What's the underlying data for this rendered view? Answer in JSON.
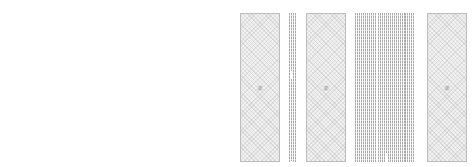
{
  "pages": [
    {
      "figures": [
        {
          "label": "Fig",
          "x": 8,
          "w": 40
        },
        {
          "label": "Fig",
          "x": 72,
          "w": 40
        },
        {
          "label": "Fig",
          "x": 185,
          "w": 40
        }
      ],
      "columns": [
        {
          "x": 52,
          "top": 13,
          "lines": [
            {
              "dx": 0,
              "top": 0,
              "h": 149
            },
            {
              "dx": 2,
              "top": 0,
              "h": 140
            },
            {
              "dx": 5,
              "top": 17,
              "h": 132
            },
            {
              "dx": 7,
              "top": 22,
              "h": 127
            }
          ]
        },
        {
          "x": 61,
          "top": 13,
          "lines": [
            {
              "dx": 0,
              "top": 0,
              "h": 149
            },
            {
              "dx": 2,
              "top": 0,
              "h": 149
            },
            {
              "dx": 4,
              "top": 0,
              "h": 149
            },
            {
              "dx": 6,
              "top": 0,
              "h": 149
            }
          ]
        },
        {
          "x": 113,
          "top": 13,
          "lines": [
            {
              "dx": 0,
              "top": 0,
              "h": 149
            },
            {
              "dx": 2,
              "top": 0,
              "h": 149
            },
            {
              "dx": 4,
              "top": 0,
              "h": 149
            },
            {
              "dx": 7,
              "top": 0,
              "h": 149
            }
          ]
        },
        {
          "x": 122,
          "top": 13,
          "lines": [
            {
              "dx": 0,
              "top": 0,
              "h": 149
            },
            {
              "dx": 3,
              "top": 0,
              "h": 149
            }
          ]
        },
        {
          "x": 129,
          "top": 13,
          "lines": [
            {
              "dx": 0,
              "top": 0,
              "h": 149
            },
            {
              "dx": 2,
              "top": 0,
              "h": 149
            },
            {
              "dx": 4,
              "top": 0,
              "h": 149
            },
            {
              "dx": 6,
              "top": 0,
              "h": 149
            },
            {
              "dx": 8,
              "top": 0,
              "h": 149
            },
            {
              "dx": 10,
              "top": 0,
              "h": 149
            },
            {
              "dx": 12,
              "top": 10,
              "h": 139
            },
            {
              "dx": 14,
              "top": 15,
              "h": 134
            }
          ]
        },
        {
          "x": 150,
          "top": 13,
          "lines": [
            {
              "dx": 0,
              "top": 0,
              "h": 149
            },
            {
              "dx": 2,
              "top": 0,
              "h": 149
            },
            {
              "dx": 4,
              "top": 0,
              "h": 149
            },
            {
              "dx": 6,
              "top": 0,
              "h": 149
            },
            {
              "dx": 8,
              "top": 0,
              "h": 149
            }
          ]
        },
        {
          "x": 166,
          "top": 13,
          "lines": [
            {
              "dx": 0,
              "top": 0,
              "h": 149
            },
            {
              "dx": 2,
              "top": 0,
              "h": 149
            },
            {
              "dx": 5,
              "top": 0,
              "h": 149
            },
            {
              "dx": 7,
              "top": 0,
              "h": 149
            },
            {
              "dx": 9,
              "top": 0,
              "h": 149
            },
            {
              "dx": 11,
              "top": 0,
              "h": 149
            },
            {
              "dx": 13,
              "top": 0,
              "h": 149
            }
          ]
        }
      ]
    },
    {
      "figures": [
        {
          "label": "Fig",
          "x": 240,
          "w": 40
        },
        {
          "label": "Fig",
          "x": 306,
          "w": 40
        },
        {
          "label": "Fig",
          "x": 427,
          "w": 40
        }
      ],
      "columns": [
        {
          "x": 289,
          "top": 13,
          "lines": [
            {
              "dx": 0,
              "top": 0,
              "h": 149
            },
            {
              "dx": 2,
              "top": 0,
              "h": 58
            },
            {
              "dx": 2,
              "top": 66,
              "h": 82
            },
            {
              "dx": 4,
              "top": 0,
              "h": 149
            },
            {
              "dx": 6,
              "top": 0,
              "h": 149
            }
          ]
        },
        {
          "x": 355,
          "top": 13,
          "lines": [
            {
              "dx": 0,
              "top": 0,
              "h": 149
            },
            {
              "dx": 2,
              "top": 0,
              "h": 149
            },
            {
              "dx": 4,
              "top": 0,
              "h": 149
            },
            {
              "dx": 6,
              "top": 0,
              "h": 149
            },
            {
              "dx": 8,
              "top": 0,
              "h": 149
            },
            {
              "dx": 10,
              "top": 0,
              "h": 149
            },
            {
              "dx": 12,
              "top": 0,
              "h": 149
            },
            {
              "dx": 14,
              "top": 0,
              "h": 149
            },
            {
              "dx": 16,
              "top": 0,
              "h": 149
            },
            {
              "dx": 18,
              "top": 0,
              "h": 149
            },
            {
              "dx": 20,
              "top": 0,
              "h": 149
            }
          ]
        },
        {
          "x": 378,
          "top": 13,
          "lines": [
            {
              "dx": 0,
              "top": 0,
              "h": 149
            },
            {
              "dx": 2,
              "top": 0,
              "h": 149
            },
            {
              "dx": 4,
              "top": 0,
              "h": 149
            },
            {
              "dx": 6,
              "top": 0,
              "h": 149
            },
            {
              "dx": 8,
              "top": 0,
              "h": 140
            },
            {
              "dx": 10,
              "top": 0,
              "h": 149
            },
            {
              "dx": 12,
              "top": 0,
              "h": 149
            },
            {
              "dx": 14,
              "top": 0,
              "h": 149
            },
            {
              "dx": 16,
              "top": 0,
              "h": 149
            },
            {
              "dx": 18,
              "top": 0,
              "h": 149
            },
            {
              "dx": 20,
              "top": 0,
              "h": 149
            },
            {
              "dx": 22,
              "top": 0,
              "h": 149
            },
            {
              "dx": 24,
              "top": 0,
              "h": 149
            },
            {
              "dx": 26,
              "top": 0,
              "h": 149
            }
          ]
        },
        {
          "x": 405,
          "top": 13,
          "lines": [
            {
              "dx": 0,
              "top": 0,
              "h": 149
            },
            {
              "dx": 2,
              "top": 0,
              "h": 149
            },
            {
              "dx": 4,
              "top": 0,
              "h": 149
            },
            {
              "dx": 6,
              "top": 0,
              "h": 149
            },
            {
              "dx": 8,
              "top": 0,
              "h": 149
            }
          ]
        }
      ]
    }
  ]
}
